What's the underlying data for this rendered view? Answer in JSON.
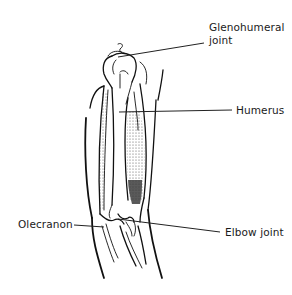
{
  "diagram": {
    "labels": [
      {
        "id": "glenohumeral-joint",
        "text": "Glenohumeral\njoint",
        "x": 209,
        "y": 21,
        "leader": {
          "x1": 118,
          "y1": 57,
          "x2": 204,
          "y2": 43
        }
      },
      {
        "id": "humerus",
        "text": "Humerus",
        "x": 236,
        "y": 104,
        "leader": {
          "x1": 119,
          "y1": 112,
          "x2": 232,
          "y2": 110
        }
      },
      {
        "id": "olecranon",
        "text": "Olecranon",
        "x": 18,
        "y": 224,
        "leader": {
          "x1": 74,
          "y1": 225,
          "x2": 104,
          "y2": 227
        }
      },
      {
        "id": "elbow-joint",
        "text": "Elbow joint",
        "x": 225,
        "y": 232,
        "leader": {
          "x1": 118,
          "y1": 219,
          "x2": 220,
          "y2": 232
        }
      }
    ],
    "colors": {
      "line": "#111111",
      "text": "#1a1a1a",
      "background": "#ffffff"
    }
  }
}
